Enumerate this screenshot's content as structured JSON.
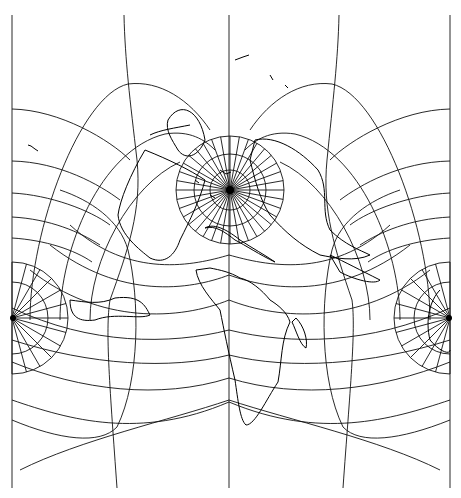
{
  "map": {
    "type": "world-projection",
    "description": "Graticule-only world map in a pole-centered projection with coastlines",
    "colors": {
      "background": "#ffffff",
      "lines": "#111111",
      "coast": "#000000"
    },
    "poles": [
      {
        "name": "north-pole",
        "x": 230,
        "y": 190
      },
      {
        "name": "left-pole",
        "x": 12,
        "y": 318
      },
      {
        "name": "right-pole",
        "x": 450,
        "y": 318
      }
    ]
  }
}
